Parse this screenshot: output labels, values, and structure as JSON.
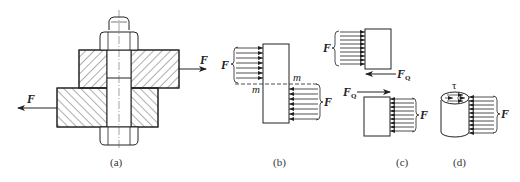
{
  "figure": {
    "panels": [
      {
        "id": "a",
        "caption": "(a)",
        "description": "Bolted lap joint: two hatched plates clamped by bolt and nuts, pulled apart by opposite forces F"
      },
      {
        "id": "b",
        "caption": "(b)",
        "description": "Bolt shank free body with distributed load F on upper-left and lower-right, shear plane m-m"
      },
      {
        "id": "c",
        "caption": "(c)",
        "description": "Bolt cut at shear plane; upper and lower parts with shear force FQ"
      },
      {
        "id": "d",
        "caption": "(d)",
        "description": "Cylindrical bolt segment with shear stress tau on cross-section"
      }
    ],
    "labels": {
      "force": "F",
      "shear_force": "F",
      "shear_force_sub": "Q",
      "section": "m",
      "shear_stress": "τ"
    },
    "colors": {
      "line": "#222222",
      "background": "#ffffff"
    }
  }
}
